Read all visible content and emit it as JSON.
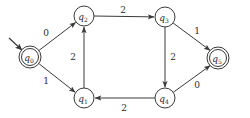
{
  "diagram": {
    "type": "finite-state-automaton",
    "title": "",
    "colors": {
      "stroke": "#3a3a3a",
      "text": "#2b2b2b",
      "background": "#ffffff"
    },
    "states": [
      {
        "id": "q0",
        "name": "q",
        "sub": "0",
        "x": 30,
        "y": 57,
        "r": 11,
        "accepting": true,
        "start": true
      },
      {
        "id": "q2",
        "name": "q",
        "sub": "2",
        "x": 84,
        "y": 16,
        "r": 10,
        "accepting": false,
        "start": false
      },
      {
        "id": "q3",
        "name": "q",
        "sub": "3",
        "x": 165,
        "y": 17,
        "r": 10,
        "accepting": false,
        "start": false
      },
      {
        "id": "q1",
        "name": "q",
        "sub": "1",
        "x": 84,
        "y": 98,
        "r": 10,
        "accepting": false,
        "start": false
      },
      {
        "id": "q4",
        "name": "q",
        "sub": "4",
        "x": 165,
        "y": 98,
        "r": 10,
        "accepting": false,
        "start": false
      },
      {
        "id": "q5",
        "name": "q",
        "sub": "5",
        "x": 218,
        "y": 58,
        "r": 11,
        "accepting": true,
        "start": false
      }
    ],
    "transitions": [
      {
        "from": "q0",
        "to": "q2",
        "label": "0",
        "lx": 46,
        "ly": 33
      },
      {
        "from": "q0",
        "to": "q1",
        "label": "1",
        "lx": 46,
        "ly": 81
      },
      {
        "from": "q2",
        "to": "q3",
        "label": "2",
        "lx": 123,
        "ly": 10
      },
      {
        "from": "q1",
        "to": "q2",
        "label": "2",
        "lx": 73,
        "ly": 57
      },
      {
        "from": "q3",
        "to": "q4",
        "label": "2",
        "lx": 173,
        "ly": 57
      },
      {
        "from": "q3",
        "to": "q5",
        "label": "1",
        "lx": 197,
        "ly": 31
      },
      {
        "from": "q4",
        "to": "q5",
        "label": "0",
        "lx": 197,
        "ly": 85
      },
      {
        "from": "q4",
        "to": "q1",
        "label": "2",
        "lx": 124,
        "ly": 108
      }
    ],
    "start_arrow": {
      "x1": 9,
      "y1": 38,
      "x2": 22,
      "y2": 50
    }
  }
}
